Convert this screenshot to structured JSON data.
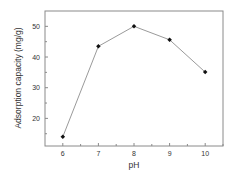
{
  "chart_data": {
    "type": "line",
    "title": "",
    "xlabel": "pH",
    "ylabel": "Adsorption capacity (mg/g)",
    "x": [
      6,
      7,
      8,
      9,
      10
    ],
    "series": [
      {
        "name": "Adsorption capacity",
        "values": [
          14.0,
          43.5,
          50.0,
          45.6,
          35.1
        ]
      }
    ],
    "xlim": [
      5.5,
      10.5
    ],
    "ylim": [
      11,
      55
    ],
    "xticks": [
      6,
      7,
      8,
      9,
      10
    ],
    "yticks": [
      20,
      30,
      40,
      50
    ],
    "grid": false,
    "legend": null,
    "marker": "filled-diamond",
    "line_color": "#9a9a9a",
    "marker_color": "#111111"
  }
}
